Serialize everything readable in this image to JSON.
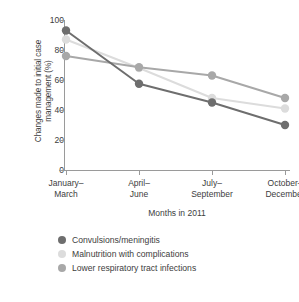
{
  "chart_data": {
    "type": "line",
    "title": "",
    "xlabel": "Months in 2011",
    "ylabel": "Changes made to initial case management (%)",
    "ylabel_line1": "Changes made to initial case",
    "ylabel_line2": "management (%)",
    "categories": [
      "January–March",
      "April–June",
      "July–September",
      "October–December"
    ],
    "categories_split": [
      {
        "l1": "January–",
        "l2": "March"
      },
      {
        "l1": "April–",
        "l2": "June"
      },
      {
        "l1": "July–",
        "l2": "September"
      },
      {
        "l1": "October–",
        "l2": "December"
      }
    ],
    "ylim": [
      0,
      100
    ],
    "yticks": [
      0,
      20,
      40,
      60,
      80,
      100
    ],
    "ytick_labels": [
      "0",
      "20",
      "40",
      "60",
      "80",
      "100"
    ],
    "grid": false,
    "legend_position": "bottom-left",
    "series": [
      {
        "name": "Convulsions/meningitis",
        "color": "#6e6e6e",
        "values": [
          93,
          57.5,
          45,
          30
        ]
      },
      {
        "name": "Malnutrition with complications",
        "color": "#dcdcdc",
        "values": [
          87,
          68,
          48,
          41
        ]
      },
      {
        "name": "Lower respiratory tract infections",
        "color": "#a8a8a8",
        "values": [
          76,
          68.5,
          63,
          48
        ]
      }
    ]
  },
  "legend": {
    "items": [
      {
        "label": "Convulsions/meningitis",
        "color": "#6e6e6e"
      },
      {
        "label": "Malnutrition with complications",
        "color": "#dcdcdc"
      },
      {
        "label": "Lower respiratory tract infections",
        "color": "#a8a8a8"
      }
    ]
  }
}
